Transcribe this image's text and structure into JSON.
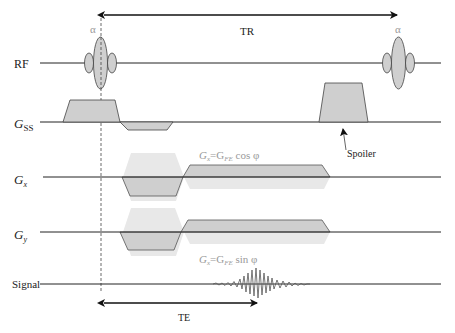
{
  "diagram": {
    "type": "MRI pulse sequence timing diagram (spoiled gradient echo)",
    "rows": {
      "rf": "RF",
      "gss_main": "G",
      "gss_sub": "SS",
      "gx_main": "G",
      "gx_sub": "x",
      "gy_main": "G",
      "gy_sub": "y",
      "signal": "Signal"
    },
    "annotations": {
      "flip_angle_1": "α",
      "flip_angle_2": "α",
      "tr": "TR",
      "te": "TE",
      "spoiler": "Spoiler",
      "gx_formula": {
        "g1": "G",
        "s1": "x",
        "eq": "=G",
        "s2": "FE",
        "rest": " cos φ"
      },
      "gy_formula": {
        "g1": "G",
        "s1": "x",
        "eq": "=G",
        "s2": "FE",
        "rest": " sin φ"
      }
    },
    "colors": {
      "line": "#222222",
      "fill": "#cfcfcf",
      "light_fill": "#e6e6e6",
      "label_gray": "#999999"
    }
  }
}
